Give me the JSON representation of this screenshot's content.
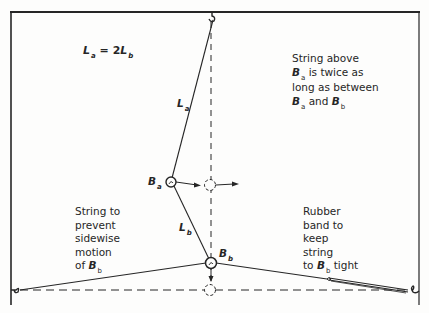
{
  "labels": {
    "equation": {
      "lhs": "L",
      "lhs_sub": "a",
      "op": " = 2",
      "rhs": "L",
      "rhs_sub": "b"
    },
    "la": {
      "main": "L",
      "sub": "a"
    },
    "lb": {
      "main": "L",
      "sub": "b"
    },
    "ba": {
      "main": "B",
      "sub": "a"
    },
    "bb": {
      "main": "B",
      "sub": "b"
    },
    "note_top_right": {
      "line1": "String above",
      "line2_b": "B",
      "line2_sub": "a",
      "line2_rest": " is twice as",
      "line3": "long as between",
      "line4_b1": "B",
      "line4_sub1": "a",
      "line4_mid": " and ",
      "line4_b2": "B",
      "line4_sub2": "b"
    },
    "note_left": {
      "line1": "String to",
      "line2": "prevent",
      "line3": "sidewise",
      "line4": "motion",
      "line5_pre": "of ",
      "line5_b": "B",
      "line5_sub": "b"
    },
    "note_right": {
      "line1": "Rubber",
      "line2": "band to",
      "line3": "keep",
      "line4": "string",
      "line5_pre": "to ",
      "line5_b": "B",
      "line5_sub": "b",
      "line5_rest": " tight"
    }
  },
  "colors": {
    "ink": "#262626",
    "paper": "#fdfdfc"
  }
}
